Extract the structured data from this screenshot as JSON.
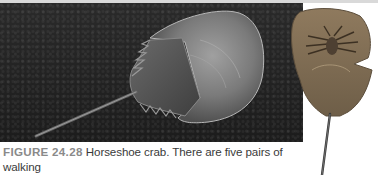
{
  "figure": {
    "label": "FIGURE 24.28",
    "caption_line1": " Horseshoe crab. There are five pairs of walking",
    "caption_line2": "legs (visible in the photo of the underside at right), and the final",
    "images": [
      {
        "name": "horseshoe-crab-top-view",
        "description": "Horseshoe crab on dark sand, dorsal view"
      },
      {
        "name": "horseshoe-crab-underside",
        "description": "Underside of horseshoe crab showing walking legs"
      }
    ]
  },
  "colors": {
    "sand": "#222222",
    "shell": "#8a8a8a",
    "caption_label": "#8a8a8a",
    "caption_text": "#3a3a3a"
  }
}
